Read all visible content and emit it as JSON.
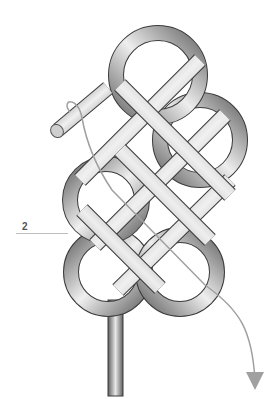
{
  "figure": {
    "step_label": "2",
    "elements": [
      "rope-knot",
      "rope-end-whipped",
      "tail-standing-part",
      "threading-path-arrow",
      "leader-line"
    ]
  },
  "colors": {
    "rope_light": "#f2f2f2",
    "rope_mid": "#a8a8a8",
    "rope_dark": "#5a5a5a",
    "outline": "#3a3a3a",
    "path_line": "#a0a0a0",
    "background": "#ffffff"
  }
}
